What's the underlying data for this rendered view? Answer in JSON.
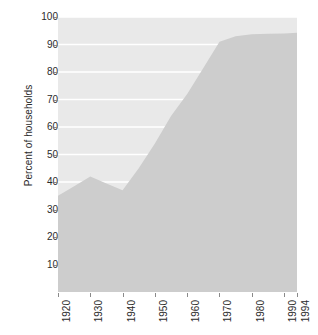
{
  "chart_data": {
    "type": "area",
    "title": "",
    "subtitle": "",
    "xlabel": "",
    "ylabel": "Percent of households",
    "xlim": [
      1920,
      1994
    ],
    "ylim": [
      0,
      100
    ],
    "grid": true,
    "grid_color": "#ffffff",
    "legend": "none",
    "fill_color": "#cdcdcd",
    "panel_background": "#e9e9e9",
    "axis_text_color": "#2b2b2b",
    "x_tick_labels": [
      "1920",
      "1930",
      "1940",
      "1950",
      "1960",
      "1970",
      "1980",
      "1990",
      "1994"
    ],
    "x_tick_values": [
      1920,
      1930,
      1940,
      1950,
      1960,
      1970,
      1980,
      1990,
      1994
    ],
    "y_tick_labels": [
      "10",
      "20",
      "30",
      "40",
      "50",
      "60",
      "70",
      "80",
      "90",
      "100"
    ],
    "y_tick_values": [
      10,
      20,
      30,
      40,
      50,
      60,
      70,
      80,
      90,
      100
    ],
    "x": [
      1920,
      1925,
      1930,
      1935,
      1940,
      1945,
      1950,
      1955,
      1960,
      1965,
      1970,
      1975,
      1980,
      1985,
      1990,
      1994
    ],
    "values": [
      35,
      38.5,
      42,
      39.5,
      37,
      45,
      54,
      64,
      72,
      81.5,
      91,
      93,
      93.7,
      93.9,
      94,
      94.3
    ],
    "series": [
      {
        "name": "Percent of households",
        "values": [
          35,
          38.5,
          42,
          39.5,
          37,
          45,
          54,
          64,
          72,
          81.5,
          91,
          93,
          93.7,
          93.9,
          94,
          94.3
        ]
      }
    ]
  }
}
